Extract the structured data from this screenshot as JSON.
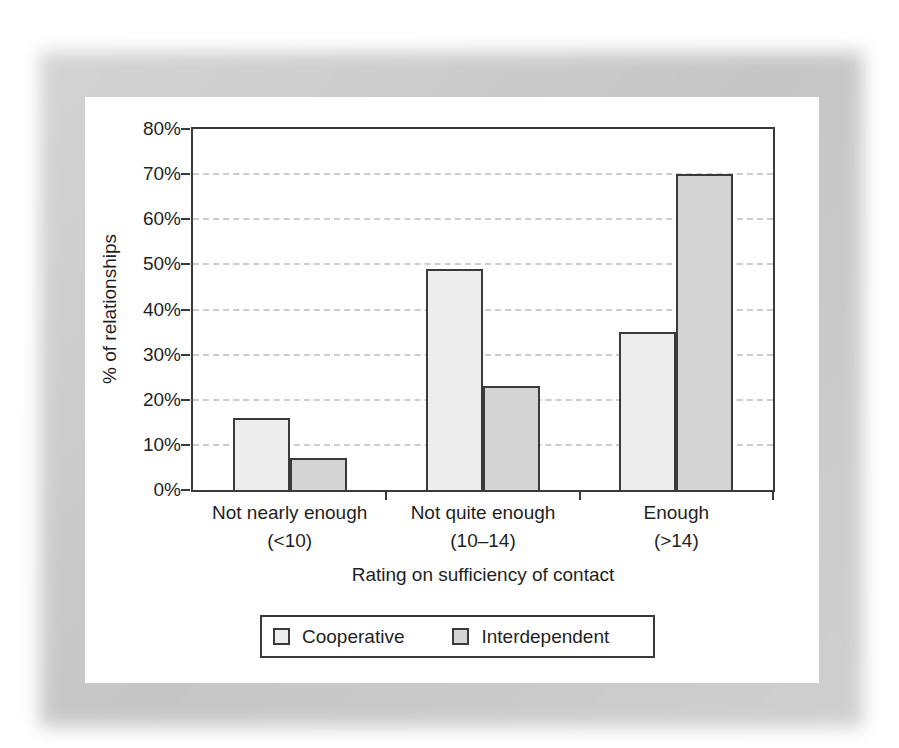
{
  "figure": {
    "background": "#ffffff",
    "frame_color": "#c9c9c9",
    "panel_color": "#ffffff",
    "axis_color": "#3a3a3a",
    "gridline_color": "#cccccc",
    "text_color": "#1f1f1f"
  },
  "chart_data": {
    "type": "bar",
    "title": "",
    "xlabel": "Rating on sufficiency of contact",
    "ylabel": "% of relationships",
    "ylim": [
      0,
      80
    ],
    "y_ticks": [
      "0%",
      "10%",
      "20%",
      "30%",
      "40%",
      "50%",
      "60%",
      "70%",
      "80%"
    ],
    "grid": "horizontal-dashed",
    "legend_position": "bottom",
    "categories": [
      {
        "label": "Not nearly enough",
        "range": "(<10)"
      },
      {
        "label": "Not quite enough",
        "range": "(10–14)"
      },
      {
        "label": "Enough",
        "range": "(>14)"
      }
    ],
    "series": [
      {
        "name": "Cooperative",
        "color": "#ededed",
        "values": [
          16,
          49,
          35
        ]
      },
      {
        "name": "Interdependent",
        "color": "#d4d4d4",
        "values": [
          7,
          23,
          70
        ]
      }
    ]
  }
}
